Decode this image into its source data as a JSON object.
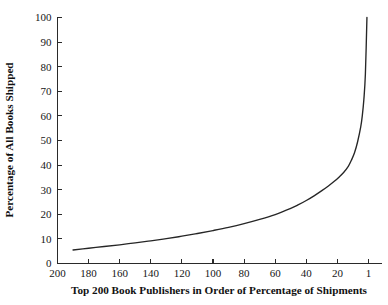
{
  "chart_data": {
    "type": "line",
    "title": "",
    "subtitle": "",
    "xlabel": "Top 200 Book Publishers in Order of Percentage of Shipments",
    "ylabel": "Percentage of All Books Shipped",
    "grid": false,
    "legend": null,
    "legend_position": "none",
    "x_axis_reversed": true,
    "xlim": [
      210,
      0
    ],
    "ylim": [
      0,
      100
    ],
    "xticks": [
      200,
      180,
      160,
      140,
      120,
      100,
      80,
      60,
      40,
      20,
      1
    ],
    "xtick_labels": [
      "200",
      "180",
      "160",
      "140",
      "120",
      "100",
      "80",
      "60",
      "40",
      "20",
      "1"
    ],
    "yticks": [
      0,
      10,
      20,
      30,
      40,
      50,
      60,
      70,
      80,
      90,
      100
    ],
    "ytick_labels": [
      "0",
      "10",
      "20",
      "30",
      "40",
      "50",
      "60",
      "70",
      "80",
      "90",
      "100"
    ],
    "series": [
      {
        "name": "Cumulative percentage of all books shipped",
        "x": [
          190,
          180,
          170,
          160,
          150,
          140,
          130,
          120,
          110,
          100,
          90,
          80,
          70,
          60,
          50,
          45,
          40,
          35,
          30,
          26,
          22,
          19,
          16,
          13,
          11,
          9,
          7,
          5,
          4,
          3,
          2,
          1
        ],
        "values": [
          5.5,
          6.2,
          6.9,
          7.6,
          8.4,
          9.2,
          10.1,
          11.1,
          12.2,
          13.4,
          14.7,
          16.2,
          17.9,
          19.9,
          22.4,
          23.9,
          25.6,
          27.5,
          29.6,
          31.4,
          33.4,
          35.1,
          37.0,
          39.5,
          42.0,
          45.0,
          49.5,
          55.5,
          60.0,
          66.5,
          77.0,
          100.0
        ]
      }
    ],
    "curve_color": "#262626",
    "axis_color": "#2a2a2a",
    "background_color": "#ffffff",
    "text_color": "#161616"
  },
  "axes": {
    "x_title": "Top 200 Book Publishers in Order of Percentage of Shipments",
    "y_title": "Percentage of All Books Shipped"
  }
}
